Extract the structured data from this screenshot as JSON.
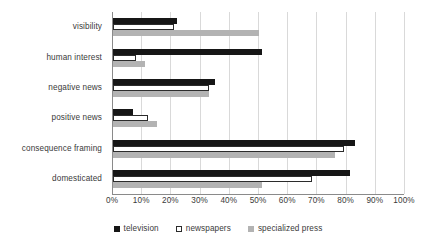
{
  "chart_data": {
    "type": "bar",
    "orientation": "horizontal",
    "title": "",
    "xlabel": "",
    "ylabel": "",
    "xlim": [
      0,
      100
    ],
    "xtick_labels": [
      "0%",
      "10%",
      "20%",
      "30%",
      "40%",
      "50%",
      "60%",
      "70%",
      "80%",
      "90%",
      "100%"
    ],
    "xtick_values": [
      0,
      10,
      20,
      30,
      40,
      50,
      60,
      70,
      80,
      90,
      100
    ],
    "grid": true,
    "legend_position": "bottom",
    "categories": [
      "visibility",
      "human interest",
      "negative news",
      "positive news",
      "consequence framing",
      "domesticated"
    ],
    "series": [
      {
        "name": "television",
        "color": "#161616",
        "values": [
          22,
          51,
          35,
          7,
          83,
          81
        ]
      },
      {
        "name": "newspapers",
        "color": "#ffffff",
        "values": [
          21,
          8,
          33,
          12,
          79,
          68
        ]
      },
      {
        "name": "specialized press",
        "color": "#b3b3b3",
        "values": [
          50,
          11,
          33,
          15,
          76,
          51
        ]
      }
    ]
  },
  "legend": {
    "items": [
      {
        "label": "television",
        "swatch": "black-square-icon"
      },
      {
        "label": "newspapers",
        "swatch": "white-square-icon"
      },
      {
        "label": "specialized press",
        "swatch": "grey-square-icon"
      }
    ]
  }
}
